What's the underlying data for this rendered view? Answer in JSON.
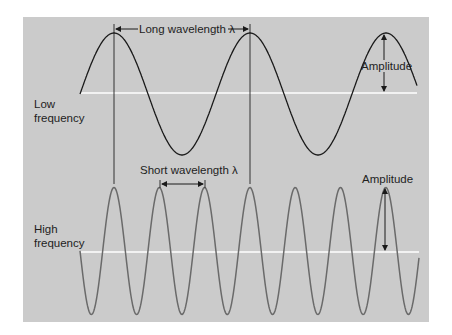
{
  "top_wave": {
    "label_line1": "Low",
    "label_line2": "frequency",
    "wavelength_label": "Long wavelength λ",
    "amplitude_label": "Amplitude",
    "color": "#1a1a1a"
  },
  "bottom_wave": {
    "label_line1": "High",
    "label_line2": "frequency",
    "wavelength_label": "Short wavelength λ",
    "amplitude_label": "Amplitude",
    "color": "#6a6a6a"
  },
  "colors": {
    "panel": "#cbcbcb",
    "axis": "#ffffff",
    "guide": "#333333"
  }
}
